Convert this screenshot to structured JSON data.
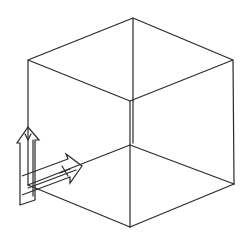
{
  "diagram": {
    "type": "isometric-cube-with-axis-arrows",
    "stroke_color": "#2a2a2a",
    "background": "#ffffff",
    "cube": {
      "vertices": {
        "top": [
          133,
          18
        ],
        "top_left": [
          28,
          60
        ],
        "top_right": [
          233,
          60
        ],
        "front_top": [
          130,
          101
        ],
        "hidden_back_bottom": [
          130,
          145
        ],
        "bottom_left": [
          28,
          185
        ],
        "bottom_right": [
          234,
          184
        ],
        "bottom": [
          130,
          227
        ]
      }
    },
    "arrows": [
      {
        "name": "up-arrow",
        "direction": "up",
        "tip": [
          28,
          127
        ]
      },
      {
        "name": "right-arrow",
        "direction": "upper-right",
        "tip": [
          82,
          166
        ]
      }
    ],
    "marks": [
      "v-mark-on-up-arrow",
      "x-mark-on-right-arrow"
    ]
  }
}
